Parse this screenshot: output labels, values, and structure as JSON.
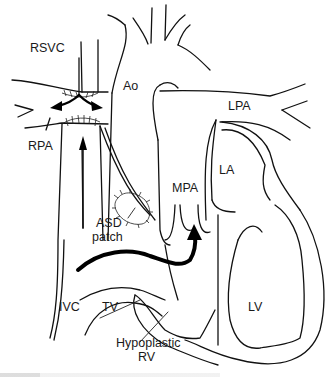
{
  "diagram": {
    "type": "anatomical line drawing",
    "colors": {
      "line": "#111111",
      "background": "#ffffff",
      "arrow": "#000000"
    },
    "labels": {
      "rsvc": "RSVC",
      "rpa": "RPA",
      "ao": "Ao",
      "lpa": "LPA",
      "la": "LA",
      "mpa": "MPA",
      "asd_line1": "ASD",
      "asd_line2": "patch",
      "ivc": "IVC",
      "tv": "TV",
      "lv": "LV",
      "hypo_line1": "Hypoplastic",
      "hypo_line2": "RV"
    }
  }
}
